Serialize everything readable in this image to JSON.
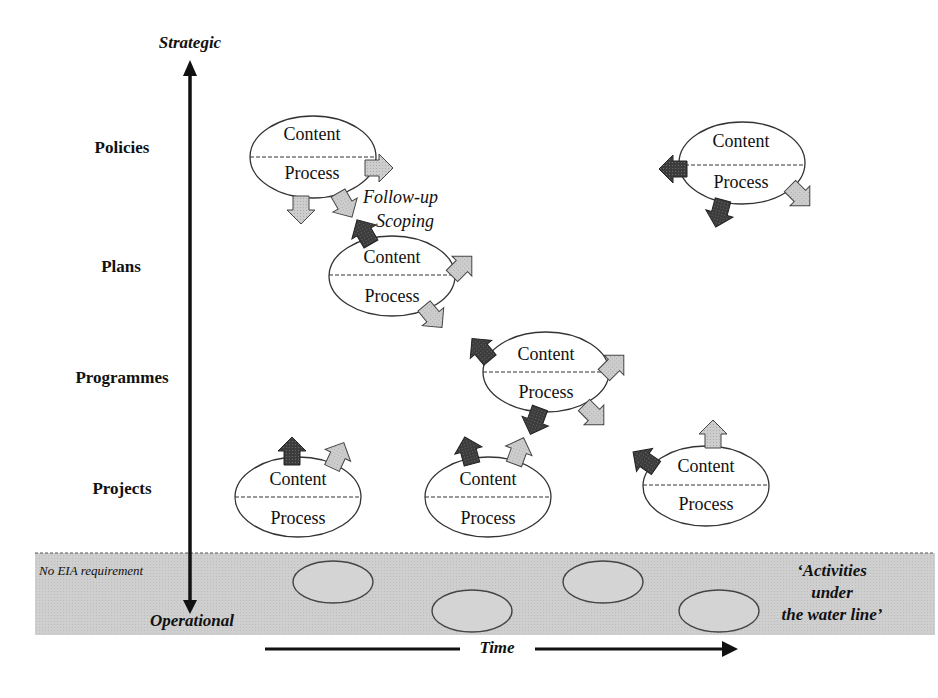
{
  "axis": {
    "top_label": "Strategic",
    "bottom_label": "Operational",
    "time_label": "Time"
  },
  "levels": [
    {
      "label": "Policies"
    },
    {
      "label": "Plans"
    },
    {
      "label": "Programmes"
    },
    {
      "label": "Projects"
    }
  ],
  "annotations": {
    "follow_up": "Follow-up",
    "scoping": "Scoping"
  },
  "ellipses": {
    "content_label": "Content",
    "process_label": "Process"
  },
  "waterline": {
    "left_label": "No EIA requirement",
    "right_label_line1": "‘Activities",
    "right_label_line2": "under",
    "right_label_line3": "the water line’"
  },
  "colors": {
    "dark_arrow": "#3a3a3a",
    "light_arrow": "#c8c8c8",
    "waterline_band": "#cfcfcf",
    "ellipse_stroke": "#333333"
  }
}
